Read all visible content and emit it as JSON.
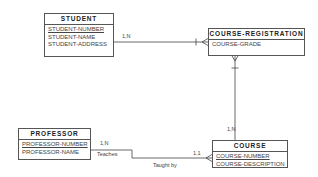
{
  "diagram": {
    "type": "entity-relationship",
    "entities": [
      {
        "id": "student",
        "name": "STUDENT",
        "attributes": [
          {
            "name": "STUDENT-NUMBER",
            "primary_key": true
          },
          {
            "name": "STUDENT-NAME",
            "primary_key": false
          },
          {
            "name": "STUDENT-ADDRESS",
            "primary_key": false
          }
        ]
      },
      {
        "id": "course_registration",
        "name": "COURSE-REGISTRATION",
        "attributes": [
          {
            "name": "COURSE-GRADE",
            "primary_key": false
          }
        ]
      },
      {
        "id": "professor",
        "name": "PROFESSOR",
        "attributes": [
          {
            "name": "PROFESSOR-NUMBER",
            "primary_key": true
          },
          {
            "name": "PROFESSOR-NAME",
            "primary_key": false
          }
        ]
      },
      {
        "id": "course",
        "name": "COURSE",
        "attributes": [
          {
            "name": "COURSE-NUMBER",
            "primary_key": true
          },
          {
            "name": "COURSE-DESCRIPTION",
            "primary_key": false
          }
        ]
      }
    ],
    "relationships": [
      {
        "from": "STUDENT",
        "to": "COURSE-REGISTRATION",
        "cardinality": "1,N"
      },
      {
        "from": "COURSE",
        "to": "COURSE-REGISTRATION",
        "cardinality": "1,N"
      },
      {
        "from": "PROFESSOR",
        "to": "COURSE",
        "cardinality_from": "1,N",
        "cardinality_to": "1,1",
        "label_forward": "Teaches",
        "label_reverse": "Taught by"
      }
    ],
    "labels": {
      "student_cr_card": "1,N",
      "course_cr_card": "1,N",
      "prof_card": "1,N",
      "course_prof_card": "1,1",
      "teaches": "Teaches",
      "taught_by": "Taught by"
    }
  }
}
